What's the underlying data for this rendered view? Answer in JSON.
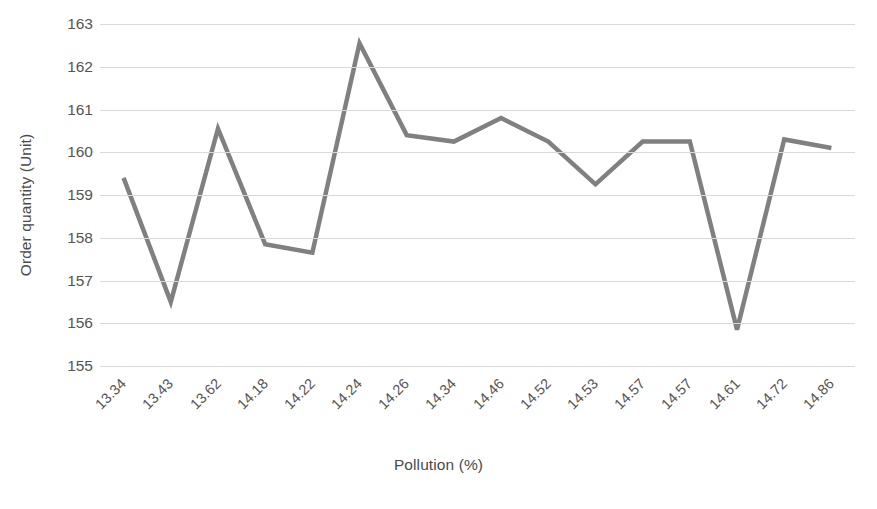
{
  "chart_data": {
    "type": "line",
    "title": "",
    "xlabel": "Pollution (%)",
    "ylabel": "Order quantity (Unit)",
    "categories": [
      "13.34",
      "13.43",
      "13.62",
      "14.18",
      "14.22",
      "14.24",
      "14.26",
      "14.34",
      "14.46",
      "14.52",
      "14.53",
      "14.57",
      "14.57",
      "14.61",
      "14.72",
      "14.86"
    ],
    "values": [
      159.4,
      156.5,
      160.55,
      157.85,
      157.65,
      162.55,
      160.4,
      160.25,
      160.8,
      160.25,
      159.25,
      160.25,
      160.25,
      155.85,
      160.3,
      160.1
    ],
    "series": [
      {
        "name": "Order quantity (Unit)",
        "values": [
          159.4,
          156.5,
          160.55,
          157.85,
          157.65,
          162.55,
          160.4,
          160.25,
          160.8,
          160.25,
          159.25,
          160.25,
          160.25,
          155.85,
          160.3,
          160.1
        ]
      }
    ],
    "ylim": [
      155,
      163
    ],
    "ytick_labels": [
      "163",
      "162",
      "161",
      "160",
      "159",
      "158",
      "157",
      "156",
      "155"
    ],
    "ytick_values": [
      163,
      162,
      161,
      160,
      159,
      158,
      157,
      156,
      155
    ],
    "grid": true,
    "grid_axis": "y",
    "legend": false,
    "legend_position": "none",
    "line_color": "#808080",
    "grid_color": "#d9d9d9",
    "text_color": "#555555",
    "background_color": "#ffffff",
    "line_width": 4.5,
    "markers": false
  }
}
